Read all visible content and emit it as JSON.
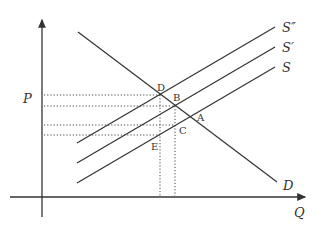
{
  "diagram": {
    "type": "supply-demand",
    "axes": {
      "y_label": "P",
      "x_label": "Q"
    },
    "curves": {
      "demand": "D",
      "supply": "S",
      "supply_prime": "S′",
      "supply_double_prime": "S″"
    },
    "points": {
      "A": "A",
      "B": "B",
      "C": "C",
      "D": "D",
      "E": "E"
    }
  }
}
